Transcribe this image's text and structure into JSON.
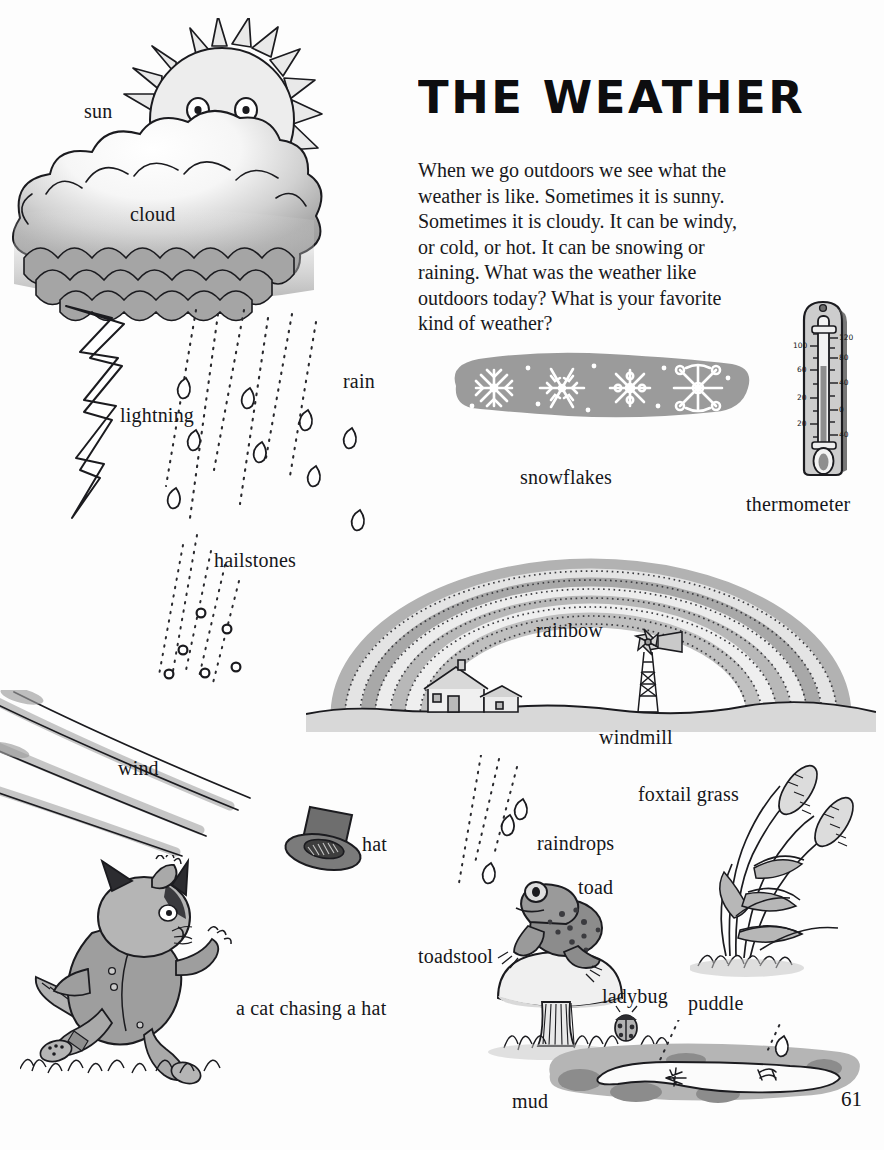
{
  "page": {
    "title": "THE WEATHER",
    "page_number": "61",
    "body_text": "When we go outdoors we see what the weather is like. Sometimes it is sunny. Sometimes it is cloudy. It can be windy, or cold, or hot. It can be snowing or raining. What was the weather like outdoors today? What is your favorite kind of weather?"
  },
  "labels": {
    "sun": "sun",
    "cloud": "cloud",
    "lightning": "lightning",
    "rain": "rain",
    "hailstones": "hailstones",
    "snowflakes": "snowflakes",
    "thermometer": "thermometer",
    "rainbow": "rainbow",
    "windmill": "windmill",
    "wind": "wind",
    "hat": "hat",
    "cat_chasing_hat": "a cat chasing a hat",
    "raindrops": "raindrops",
    "toad": "toad",
    "toadstool": "toadstool",
    "ladybug": "ladybug",
    "foxtail_grass": "foxtail grass",
    "puddle": "puddle",
    "mud": "mud"
  },
  "thermometer_scale": {
    "left_marks": [
      "100",
      "60",
      "20",
      "20"
    ],
    "right_marks": [
      "120",
      "80",
      "40",
      "0",
      "40"
    ]
  },
  "colors": {
    "paper": "#fdfdfd",
    "ink": "#16161a",
    "light_gray": "#dcdcdc",
    "mid_gray": "#a9a9a9",
    "dark_gray": "#8b8b8b",
    "snow_blob": "#9b9b9b",
    "cloud_top": "#f2f2f2",
    "cloud_bottom": "#a8a8a8",
    "cat_body": "#9e9e9e",
    "hat": "#7e7e7e",
    "rainbow_band_a": "#b4b4b4",
    "rainbow_band_b": "#e2e2e2"
  }
}
